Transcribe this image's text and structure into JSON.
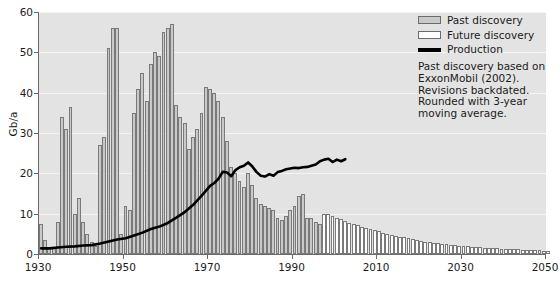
{
  "chart_data": {
    "type": "bar",
    "title": "",
    "xlabel": "",
    "ylabel": "Gb/a",
    "xlim": [
      1930,
      2050
    ],
    "ylim": [
      0,
      60
    ],
    "yticks": [
      0,
      10,
      20,
      30,
      40,
      50,
      60
    ],
    "xticks": [
      1930,
      1950,
      1970,
      1990,
      2010,
      2030,
      2050
    ],
    "grid": "horizontal",
    "legend_position": "top-right",
    "series": [
      {
        "name": "Past discovery",
        "type": "bar",
        "color": "#c9c9c9",
        "x": [
          1930,
          1931,
          1932,
          1933,
          1934,
          1935,
          1936,
          1937,
          1938,
          1939,
          1940,
          1941,
          1942,
          1943,
          1944,
          1945,
          1946,
          1947,
          1948,
          1949,
          1950,
          1951,
          1952,
          1953,
          1954,
          1955,
          1956,
          1957,
          1958,
          1959,
          1960,
          1961,
          1962,
          1963,
          1964,
          1965,
          1966,
          1967,
          1968,
          1969,
          1970,
          1971,
          1972,
          1973,
          1974,
          1975,
          1976,
          1977,
          1978,
          1979,
          1980,
          1981,
          1982,
          1983,
          1984,
          1985,
          1986,
          1987,
          1988,
          1989,
          1990,
          1991,
          1992,
          1993,
          1994,
          1995,
          1996
        ],
        "values": [
          7.5,
          3.5,
          1.5,
          1.5,
          8.0,
          34.0,
          31.0,
          36.5,
          10.0,
          14.0,
          8.0,
          5.0,
          3.0,
          2.0,
          27.0,
          29.0,
          51.0,
          56.0,
          56.0,
          5.0,
          12.0,
          11.0,
          35.0,
          41.0,
          45.0,
          38.0,
          47.0,
          50.0,
          49.0,
          55.0,
          56.0,
          57.0,
          37.0,
          34.0,
          32.5,
          26.0,
          29.0,
          31.0,
          35.0,
          41.5,
          41.0,
          40.0,
          38.0,
          34.0,
          28.0,
          21.5,
          20.0,
          18.0,
          16.5,
          20.0,
          17.0,
          14.0,
          12.5,
          12.0,
          11.5,
          11.0,
          9.0,
          8.5,
          9.5,
          11.0,
          12.0,
          14.5,
          15.0,
          9.0,
          9.0,
          8.0,
          7.5
        ]
      },
      {
        "name": "Future discovery",
        "type": "bar",
        "color": "#ffffff",
        "x": [
          1997,
          1998,
          1999,
          2000,
          2001,
          2002,
          2003,
          2004,
          2005,
          2006,
          2007,
          2008,
          2009,
          2010,
          2011,
          2012,
          2013,
          2014,
          2015,
          2016,
          2017,
          2018,
          2019,
          2020,
          2021,
          2022,
          2023,
          2024,
          2025,
          2026,
          2027,
          2028,
          2029,
          2030,
          2031,
          2032,
          2033,
          2034,
          2035,
          2036,
          2037,
          2038,
          2039,
          2040,
          2041,
          2042,
          2043,
          2044,
          2045,
          2046,
          2047,
          2048,
          2049,
          2050
        ],
        "values": [
          10.0,
          10.0,
          9.5,
          9.0,
          8.6,
          8.2,
          7.8,
          7.5,
          7.1,
          6.8,
          6.5,
          6.2,
          5.9,
          5.6,
          5.3,
          5.0,
          4.8,
          4.5,
          4.3,
          4.1,
          3.9,
          3.7,
          3.5,
          3.3,
          3.1,
          3.0,
          2.8,
          2.7,
          2.5,
          2.4,
          2.3,
          2.2,
          2.1,
          2.0,
          1.9,
          1.8,
          1.7,
          1.65,
          1.6,
          1.5,
          1.45,
          1.4,
          1.35,
          1.3,
          1.25,
          1.2,
          1.15,
          1.1,
          1.05,
          1.0,
          0.95,
          0.9,
          0.85,
          0.8
        ]
      },
      {
        "name": "Production",
        "type": "line",
        "color": "#000000",
        "x": [
          1930,
          1932,
          1934,
          1936,
          1938,
          1940,
          1942,
          1944,
          1946,
          1948,
          1950,
          1952,
          1954,
          1956,
          1958,
          1960,
          1962,
          1964,
          1966,
          1968,
          1970,
          1971,
          1972,
          1973,
          1974,
          1975,
          1976,
          1977,
          1978,
          1979,
          1980,
          1981,
          1982,
          1983,
          1984,
          1985,
          1986,
          1987,
          1988,
          1989,
          1990,
          1991,
          1992,
          1993,
          1994,
          1995,
          1996,
          1997,
          1998,
          1999,
          2000,
          2001,
          2002
        ],
        "values": [
          1.4,
          1.4,
          1.6,
          1.8,
          1.9,
          2.1,
          2.2,
          2.6,
          3.1,
          3.6,
          3.9,
          4.6,
          5.3,
          6.2,
          6.8,
          7.7,
          9.0,
          10.4,
          12.2,
          14.5,
          16.9,
          17.6,
          18.7,
          20.4,
          20.2,
          19.3,
          20.8,
          21.5,
          21.9,
          22.7,
          21.7,
          20.3,
          19.4,
          19.2,
          19.8,
          19.4,
          20.3,
          20.6,
          21.0,
          21.2,
          21.4,
          21.3,
          21.5,
          21.6,
          21.9,
          22.2,
          23.0,
          23.4,
          23.6,
          22.8,
          23.4,
          23.0,
          23.5
        ]
      }
    ]
  },
  "axes": {
    "ylabel": "Gb/a",
    "ytick_labels": [
      "0",
      "10",
      "20",
      "30",
      "40",
      "50",
      "60"
    ],
    "xtick_labels": [
      "1930",
      "1950",
      "1970",
      "1990",
      "2010",
      "2030",
      "2050"
    ]
  },
  "legend": {
    "items": [
      {
        "label": "Past discovery",
        "kind": "swatch-past"
      },
      {
        "label": "Future discovery",
        "kind": "swatch-future"
      },
      {
        "label": "Production",
        "kind": "swatch-line"
      }
    ]
  },
  "annotation": {
    "lines": [
      "Past discovery based on",
      "ExxonMobil (2002).",
      "Revisions backdated.",
      "Rounded with 3-year",
      "moving average."
    ]
  },
  "colors": {
    "plot_background": "#e3e3e3",
    "gridline": "#f4f4f4",
    "past_bar_fill": "#c9c9c9",
    "future_bar_fill": "#ffffff",
    "bar_stroke": "#7a7a7a",
    "axis": "#6b6b6b",
    "production_line": "#000000",
    "text": "#1b1b1b"
  }
}
